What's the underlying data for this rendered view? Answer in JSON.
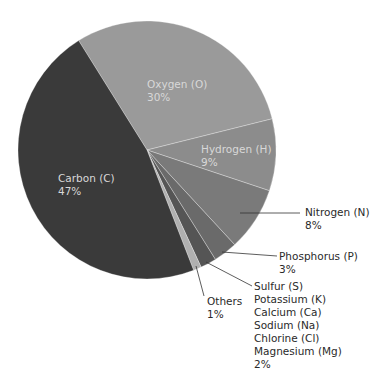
{
  "chart_data": {
    "type": "pie",
    "title": "",
    "start_angle_deg": 328,
    "direction": "clockwise",
    "slices": [
      {
        "label": "Oxygen (O)",
        "value": 30,
        "color": "#9a9a9a"
      },
      {
        "label": "Hydrogen (H)",
        "value": 9,
        "color": "#8c8c8c"
      },
      {
        "label": "Nitrogen (N)",
        "value": 8,
        "color": "#7a7a7a"
      },
      {
        "label": "Phosphorus (P)",
        "value": 3,
        "color": "#6a6a6a"
      },
      {
        "label": "Sulfur (S), Potassium (K), Calcium (Ca), Sodium (Na), Chlorine (Cl), Magnesium (Mg)",
        "value": 2,
        "color": "#555555"
      },
      {
        "label": "Others",
        "value": 1,
        "color": "#b0b0b0"
      },
      {
        "label": "Carbon (C)",
        "value": 47,
        "color": "#3a3a3a"
      }
    ]
  },
  "labels": {
    "oxygen": {
      "name": "Oxygen (O)",
      "pct": "30%"
    },
    "hydrogen": {
      "name": "Hydrogen (H)",
      "pct": "9%"
    },
    "nitrogen": {
      "name": "Nitrogen (N)",
      "pct": "8%"
    },
    "phosphorus": {
      "name": "Phosphorus (P)",
      "pct": "3%"
    },
    "minor": {
      "lines": [
        "Sulfur (S)",
        "Potassium (K)",
        "Calcium (Ca)",
        "Sodium (Na)",
        "Chlorine (Cl)",
        "Magnesium (Mg)"
      ],
      "pct": "2%"
    },
    "others": {
      "name": "Others",
      "pct": "1%"
    },
    "carbon": {
      "name": "Carbon (C)",
      "pct": "47%"
    }
  }
}
